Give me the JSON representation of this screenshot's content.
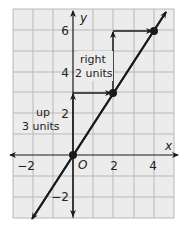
{
  "graph": {
    "x_axis_label": "x",
    "y_axis_label": "y",
    "origin_label": "O",
    "x_ticks": [
      {
        "value": -2,
        "label": "−2"
      },
      {
        "value": 2,
        "label": "2"
      },
      {
        "value": 4,
        "label": "4"
      }
    ],
    "y_ticks": [
      {
        "value": -2,
        "label": "−2"
      },
      {
        "value": 2,
        "label": "2"
      },
      {
        "value": 4,
        "label": "4"
      },
      {
        "value": 6,
        "label": "6"
      }
    ],
    "x_range": [
      -3,
      5
    ],
    "y_range": [
      -3,
      7
    ],
    "annotations": {
      "rise_line1": "up",
      "rise_line2": "3 units",
      "run_line1": "right",
      "run_line2": "2 units"
    },
    "points": [
      {
        "x": 0,
        "y": 0
      },
      {
        "x": 2,
        "y": 3
      },
      {
        "x": 4,
        "y": 6
      }
    ],
    "line": {
      "slope": 1.5,
      "intercept": 0
    },
    "colors": {
      "grid": "#b8b8b8",
      "grid_bg": "#ececec",
      "ink": "#1a1a1a"
    }
  }
}
